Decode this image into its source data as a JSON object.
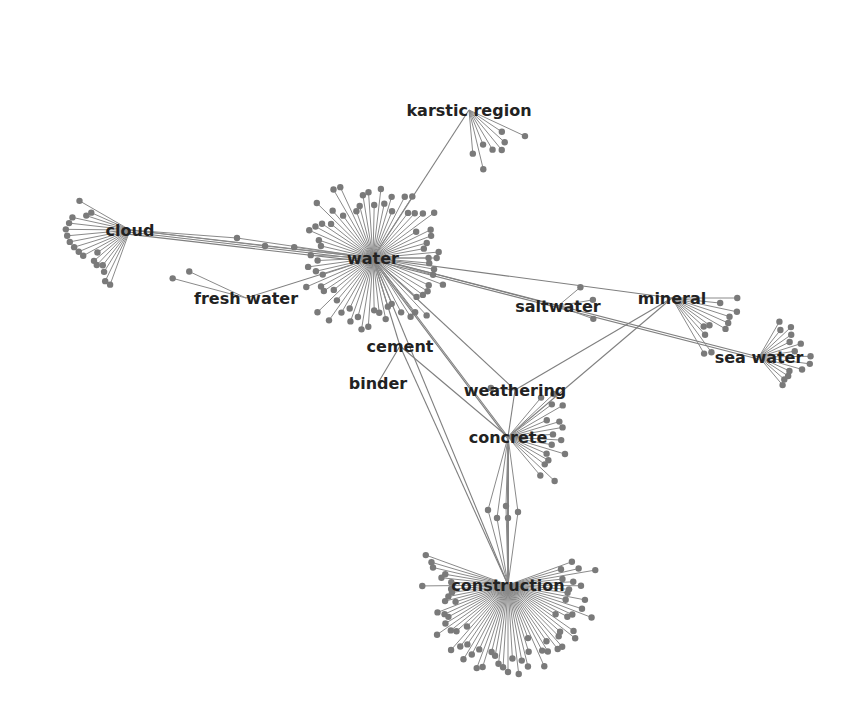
{
  "diagram": {
    "type": "network-graph",
    "colors": {
      "edge": "#7f7f7f",
      "node": "#7a7a7a",
      "label": "#222222",
      "background": "#ffffff"
    },
    "hubs": [
      {
        "id": "water",
        "label": "water",
        "x": 373,
        "y": 258,
        "leaves": 70,
        "radius": 80,
        "start": 0,
        "end": 360
      },
      {
        "id": "cloud",
        "label": "cloud",
        "x": 130,
        "y": 230,
        "leaves": 18,
        "radius": 65,
        "start": 150,
        "end": 250
      },
      {
        "id": "karstic_region",
        "label": "karstic region",
        "x": 469,
        "y": 110,
        "leaves": 8,
        "radius": 62,
        "start": 275,
        "end": 335
      },
      {
        "id": "fresh_water",
        "label": "fresh water",
        "x": 246,
        "y": 298,
        "leaves": 2,
        "radius": 80,
        "start": 155,
        "end": 165
      },
      {
        "id": "saltwater",
        "label": "saltwater",
        "x": 558,
        "y": 306,
        "leaves": 3,
        "radius": 45,
        "start": 340,
        "end": 40
      },
      {
        "id": "mineral",
        "label": "mineral",
        "x": 672,
        "y": 298,
        "leaves": 11,
        "radius": 70,
        "start": 300,
        "end": 360
      },
      {
        "id": "sea_water",
        "label": "sea water",
        "x": 759,
        "y": 357,
        "leaves": 14,
        "radius": 55,
        "start": 310,
        "end": 60
      },
      {
        "id": "cement",
        "label": "cement",
        "x": 400,
        "y": 346,
        "leaves": 0,
        "radius": 0,
        "start": 0,
        "end": 0
      },
      {
        "id": "binder",
        "label": "binder",
        "x": 378,
        "y": 383,
        "leaves": 0,
        "radius": 0,
        "start": 0,
        "end": 0
      },
      {
        "id": "weathering",
        "label": "weathering",
        "x": 515,
        "y": 390,
        "leaves": 1,
        "radius": 35,
        "start": 170,
        "end": 180
      },
      {
        "id": "concrete",
        "label": "concrete",
        "x": 508,
        "y": 437,
        "leaves": 16,
        "radius": 70,
        "start": 310,
        "end": 50
      },
      {
        "id": "construction",
        "label": "construction",
        "x": 508,
        "y": 585,
        "leaves": 65,
        "radius": 90,
        "start": 160,
        "end": 380
      }
    ],
    "edges": [
      [
        "cloud",
        "water"
      ],
      [
        "cloud",
        "water"
      ],
      [
        "cloud",
        "water"
      ],
      [
        "karstic_region",
        "water"
      ],
      [
        "fresh_water",
        "water"
      ],
      [
        "water",
        "saltwater"
      ],
      [
        "water",
        "sea_water"
      ],
      [
        "water",
        "sea_water"
      ],
      [
        "water",
        "mineral"
      ],
      [
        "water",
        "cement"
      ],
      [
        "water",
        "concrete"
      ],
      [
        "water",
        "concrete"
      ],
      [
        "water",
        "weathering"
      ],
      [
        "water",
        "construction"
      ],
      [
        "cement",
        "binder"
      ],
      [
        "cement",
        "concrete"
      ],
      [
        "cement",
        "construction"
      ],
      [
        "mineral",
        "weathering"
      ],
      [
        "mineral",
        "concrete"
      ],
      [
        "weathering",
        "concrete"
      ],
      [
        "concrete",
        "construction"
      ],
      [
        "concrete",
        "construction"
      ],
      [
        "concrete",
        "construction"
      ],
      [
        "concrete",
        "construction"
      ],
      [
        "concrete",
        "construction"
      ],
      [
        "concrete",
        "construction"
      ]
    ],
    "bridge_nodes": [
      {
        "between": [
          "concrete",
          "construction"
        ],
        "points": [
          [
            488,
            510
          ],
          [
            497,
            518
          ],
          [
            506,
            506
          ],
          [
            508,
            518
          ],
          [
            518,
            512
          ]
        ]
      },
      {
        "between": [
          "cloud",
          "water"
        ],
        "points": [
          [
            237,
            238
          ],
          [
            265,
            246
          ]
        ]
      }
    ]
  }
}
